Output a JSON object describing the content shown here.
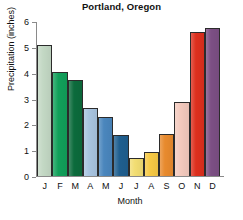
{
  "chart_data": {
    "type": "bar",
    "title": "Portland, Oregon",
    "xlabel": "Month",
    "ylabel": "Precipitation (inches)",
    "categories": [
      "J",
      "F",
      "M",
      "A",
      "M",
      "J",
      "J",
      "A",
      "S",
      "O",
      "N",
      "D"
    ],
    "month_names": [
      "January",
      "February",
      "March",
      "April",
      "May",
      "June",
      "July",
      "August",
      "September",
      "October",
      "November",
      "December"
    ],
    "values": [
      5.1,
      4.07,
      3.75,
      2.65,
      2.3,
      1.6,
      0.7,
      0.95,
      1.65,
      2.9,
      5.6,
      5.75
    ],
    "ylim": [
      0,
      6
    ],
    "yticks": [
      0,
      1,
      2,
      3,
      4,
      5,
      6
    ],
    "ytick_labels": [
      "0",
      "1",
      "2",
      "3",
      "4",
      "5",
      "6"
    ],
    "grid": false,
    "legend": "none",
    "bar_colors": [
      "#c3d8c4",
      "#11a05a",
      "#0c6b3c",
      "#a8c4e0",
      "#4a86bd",
      "#1f5f8f",
      "#f2dd72",
      "#f6c944",
      "#e88a2d",
      "#f3c9bd",
      "#dd2f1d",
      "#7c4f84"
    ],
    "bar_outline_color": "#2b2b2b",
    "axis_color": "#8a8a8a"
  }
}
